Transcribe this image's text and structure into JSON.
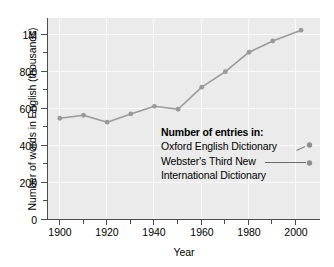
{
  "chart_data": {
    "type": "line",
    "title": "",
    "xlabel": "Year",
    "ylabel": "Number of words in English (thousands)",
    "xlim": [
      1895,
      2010
    ],
    "ylim": [
      0,
      1080
    ],
    "grid": true,
    "x_ticks": [
      1900,
      1920,
      1940,
      1960,
      1980,
      2000
    ],
    "x_tick_labels": [
      "1900",
      "1920",
      "1940",
      "1960",
      "1980",
      "2000"
    ],
    "x_minor_ticks": [
      1910,
      1930,
      1950,
      1970,
      1990
    ],
    "y_ticks": [
      0,
      200,
      400,
      600,
      800,
      1000
    ],
    "y_tick_labels": [
      "0",
      "200",
      "400",
      "600",
      "800",
      "1M"
    ],
    "y_minor_ticks": [
      100,
      300,
      500,
      700,
      900
    ],
    "legend_position": "inside-annotation",
    "series": [
      {
        "name": "Number of words in English",
        "color": "#9a9a9a",
        "x": [
          1900,
          1910,
          1920,
          1930,
          1940,
          1950,
          1960,
          1970,
          1980,
          1990,
          2002
        ],
        "values": [
          544,
          560,
          523,
          567,
          608,
          592,
          710,
          793,
          897,
          957,
          1015
        ]
      }
    ]
  },
  "annotation": {
    "title": "Number of entries in:",
    "line1": "Oxford English Dictionary",
    "line2": "Webster's Third New",
    "line3": "International Dictionary",
    "markers": [
      {
        "label": "Oxford English Dictionary",
        "year": 2002,
        "value": 443
      },
      {
        "label": "Webster's Third New International Dictionary",
        "year": 2002,
        "value": 350
      }
    ]
  },
  "colors": {
    "panel_background": "#ebebeb",
    "gridline": "#fafafa",
    "series": "#9a9a9a",
    "axis": "#4d4d4d",
    "text": "#000000",
    "page_background": "#ffffff"
  }
}
